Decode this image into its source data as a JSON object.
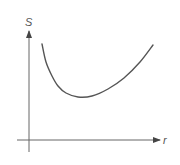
{
  "chart_data": {
    "type": "line",
    "title": "",
    "xlabel": "r",
    "ylabel": "S",
    "grid": false,
    "legend": null,
    "ticks": {
      "x": [],
      "y": []
    },
    "series": [
      {
        "name": "S(r)",
        "description": "U-shaped curve: steep descent from upper left, minimum left of center, gradual rise to upper right",
        "points_px": [
          [
            42,
            44
          ],
          [
            46,
            62
          ],
          [
            52,
            76
          ],
          [
            58,
            86
          ],
          [
            66,
            93
          ],
          [
            78,
            97
          ],
          [
            92,
            96
          ],
          [
            108,
            89
          ],
          [
            124,
            78
          ],
          [
            140,
            62
          ],
          [
            153,
            45
          ]
        ]
      }
    ],
    "axes": {
      "origin_px": [
        29,
        140
      ],
      "y_axis_top_px": 30,
      "y_axis_bottom_px": 152,
      "x_axis_left_px": 17,
      "x_axis_right_px": 160
    },
    "colors": {
      "axis": "#555555",
      "curve": "#555555",
      "background": "#ffffff"
    }
  },
  "labels": {
    "x_axis": "r",
    "y_axis": "S"
  }
}
